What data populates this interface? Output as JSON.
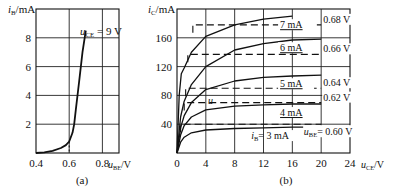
{
  "chart_data": [
    {
      "id": "a",
      "type": "line",
      "caption": "(a)",
      "title": "",
      "ylabel": "iB /mA",
      "ylabel_main": "i",
      "ylabel_sub": "B",
      "ylabel_unit": "/mA",
      "xlabel": "uBE/V",
      "xlabel_main": "u",
      "xlabel_sub": "BE",
      "xlabel_unit": "/V",
      "xlim": [
        0.4,
        0.9
      ],
      "ylim": [
        0,
        10
      ],
      "xticks": [
        "0.4",
        "0.6",
        "0.8"
      ],
      "yticks": [
        "2",
        "4",
        "6",
        "8"
      ],
      "grid": true,
      "annotation": {
        "main": "u",
        "sub": "CE",
        "text": " = 9 V"
      },
      "series": [
        {
          "name": "uCE = 9 V",
          "x": [
            0.4,
            0.45,
            0.5,
            0.55,
            0.58,
            0.6,
            0.62,
            0.63,
            0.64,
            0.66,
            0.68,
            0.7
          ],
          "y": [
            0.0,
            0.05,
            0.15,
            0.35,
            0.55,
            0.8,
            1.4,
            2.0,
            3.0,
            5.0,
            7.0,
            8.5
          ]
        }
      ]
    },
    {
      "id": "b",
      "type": "line",
      "caption": "(b)",
      "title": "",
      "ylabel": "iC /mA",
      "ylabel_main": "i",
      "ylabel_sub": "C",
      "ylabel_unit": "/mA",
      "xlabel": "uCE/V",
      "xlabel_main": "u",
      "xlabel_sub": "CE",
      "xlabel_unit": "/V",
      "xlim": [
        0,
        24
      ],
      "ylim": [
        0,
        200
      ],
      "xticks": [
        "0",
        "4",
        "8",
        "12",
        "16",
        "20",
        "24"
      ],
      "yticks": [
        "40",
        "80",
        "120",
        "160"
      ],
      "grid": true,
      "curve_label_u": "u",
      "series": [
        {
          "name": "iB = 3 mA",
          "label": "3 mA",
          "label_prefix_main": "i",
          "label_prefix_sub": "B",
          "x": [
            0,
            0.5,
            1,
            2,
            4,
            8,
            12,
            16,
            20
          ],
          "y": [
            0,
            15,
            22,
            28,
            32,
            34,
            35,
            36,
            36
          ]
        },
        {
          "name": "4 mA",
          "label": "4 mA",
          "x": [
            0,
            0.5,
            1,
            2,
            4,
            8,
            12,
            16,
            20
          ],
          "y": [
            0,
            25,
            38,
            50,
            60,
            65,
            67,
            68,
            68
          ]
        },
        {
          "name": "5 mA",
          "label": "5 mA",
          "x": [
            0,
            0.5,
            1,
            2,
            4,
            8,
            12,
            16,
            20
          ],
          "y": [
            0,
            35,
            52,
            70,
            88,
            100,
            105,
            107,
            108
          ]
        },
        {
          "name": "6 mA",
          "label": "6 mA",
          "x": [
            0,
            0.5,
            1,
            2,
            4,
            8,
            12,
            16,
            20
          ],
          "y": [
            0,
            50,
            72,
            95,
            120,
            143,
            152,
            157,
            158
          ]
        },
        {
          "name": "7 mA",
          "label": "7 mA",
          "x": [
            0,
            0.3,
            0.6,
            1,
            2,
            4,
            8,
            12,
            16
          ],
          "y": [
            0,
            80,
            110,
            118,
            140,
            162,
            178,
            186,
            190
          ]
        }
      ],
      "dashed_series": [
        {
          "name": "uBE = 0.60 V",
          "label": "= 0.60 V",
          "label_prefix_main": "u",
          "label_prefix_sub": "BE",
          "y": 40,
          "x_start": 0.5,
          "x_end": 20
        },
        {
          "name": "0.62 V",
          "label": "0.62 V",
          "y": 70,
          "x_start": 1,
          "x_end": 20
        },
        {
          "name": "0.64 V",
          "label": "0.64 V",
          "y": 90,
          "x_start": 1.2,
          "x_end": 20
        },
        {
          "name": "0.66 V",
          "label": "0.66 V",
          "y": 137,
          "x_start": 1.5,
          "x_end": 20
        },
        {
          "name": "0.68 V",
          "label": "0.68 V",
          "y": 178,
          "x_start": 2.2,
          "x_end": 20
        }
      ]
    }
  ]
}
